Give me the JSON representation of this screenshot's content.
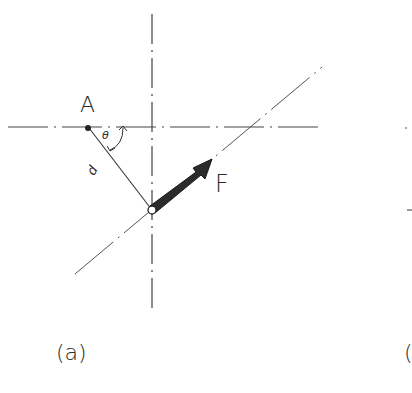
{
  "figure": {
    "panel_a": {
      "caption": "(a)",
      "point_label": "A",
      "force_label": "F",
      "angle_label": "θ",
      "distance_label": "d"
    },
    "panel_b": {
      "caption_partial": "("
    },
    "colors": {
      "line": "#3a3a3a",
      "arrow_fill": "#2b2b2b",
      "background": "#ffffff"
    }
  }
}
